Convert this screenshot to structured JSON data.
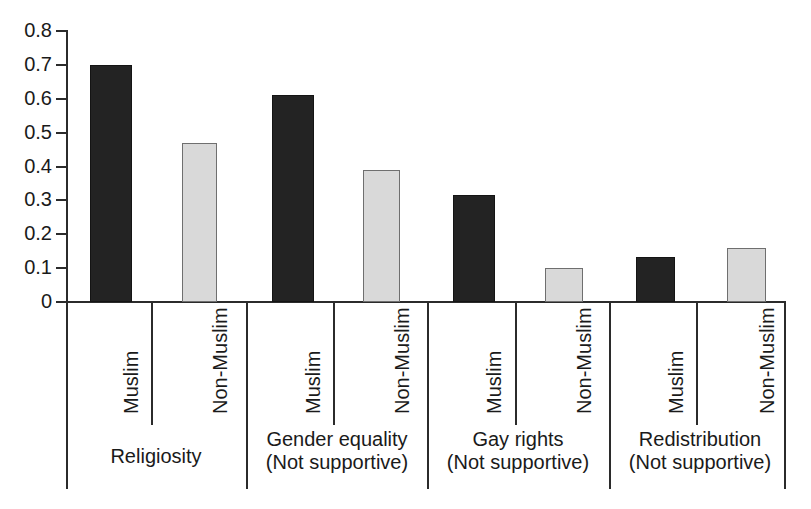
{
  "chart_data": {
    "type": "bar",
    "title": "",
    "subtitle": "",
    "xlabel": "",
    "ylabel": "",
    "ylim": [
      0,
      0.8
    ],
    "grid": false,
    "legend_position": "none",
    "categories": [
      "Religiosity",
      "Gender equality (Not supportive)",
      "Gay rights (Not supportive)",
      "Redistribution (Not supportive)"
    ],
    "series": [
      {
        "name": "Muslim",
        "values": [
          0.7,
          0.61,
          0.315,
          0.133
        ],
        "color": "#232323"
      },
      {
        "name": "Non-Muslim",
        "values": [
          0.47,
          0.39,
          0.1,
          0.158
        ],
        "color": "#d9d9d9"
      }
    ],
    "ytick_labels": [
      "0.8",
      "0.7",
      "0.6",
      "0.5",
      "0.4",
      "0.3",
      "0.2",
      "0.1",
      "0"
    ],
    "ytick_values": [
      0.8,
      0.7,
      0.6,
      0.5,
      0.4,
      0.3,
      0.2,
      0.1,
      0
    ]
  },
  "axis": {
    "y_ticks": [
      {
        "label": "0.8",
        "value": 0.8
      },
      {
        "label": "0.7",
        "value": 0.7
      },
      {
        "label": "0.6",
        "value": 0.6
      },
      {
        "label": "0.5",
        "value": 0.5
      },
      {
        "label": "0.4",
        "value": 0.4
      },
      {
        "label": "0.3",
        "value": 0.3
      },
      {
        "label": "0.2",
        "value": 0.2
      },
      {
        "label": "0.1",
        "value": 0.1
      },
      {
        "label": "0",
        "value": 0
      }
    ]
  },
  "bars": [
    {
      "series": "Muslim",
      "group": "Religiosity",
      "value": 0.7,
      "label": "Muslim",
      "fill": "dark"
    },
    {
      "series": "Non-Muslim",
      "group": "Religiosity",
      "value": 0.47,
      "label": "Non-Muslim",
      "fill": "light"
    },
    {
      "series": "Muslim",
      "group": "Gender equality (Not supportive)",
      "value": 0.61,
      "label": "Muslim",
      "fill": "dark"
    },
    {
      "series": "Non-Muslim",
      "group": "Gender equality (Not supportive)",
      "value": 0.39,
      "label": "Non-Muslim",
      "fill": "light"
    },
    {
      "series": "Muslim",
      "group": "Gay rights (Not supportive)",
      "value": 0.315,
      "label": "Muslim",
      "fill": "dark"
    },
    {
      "series": "Non-Muslim",
      "group": "Gay rights (Not supportive)",
      "value": 0.1,
      "label": "Non-Muslim",
      "fill": "light"
    },
    {
      "series": "Muslim",
      "group": "Redistribution (Not supportive)",
      "value": 0.133,
      "label": "Muslim",
      "fill": "dark"
    },
    {
      "series": "Non-Muslim",
      "group": "Redistribution (Not supportive)",
      "value": 0.158,
      "label": "Non-Muslim",
      "fill": "light"
    }
  ],
  "groups": [
    {
      "line1": "Religiosity",
      "line2": ""
    },
    {
      "line1": "Gender equality",
      "line2": "(Not supportive)"
    },
    {
      "line1": "Gay rights",
      "line2": "(Not supportive)"
    },
    {
      "line1": "Redistribution",
      "line2": "(Not supportive)"
    }
  ],
  "colors": {
    "muslim_bar": "#232323",
    "non_muslim_bar": "#d9d9d9",
    "axis": "#2b2b2b",
    "text": "#1a1a1a",
    "background": "#ffffff"
  }
}
